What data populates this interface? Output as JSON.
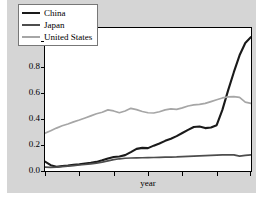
{
  "chart_data": {
    "type": "line",
    "title": "",
    "xlabel": "year",
    "ylabel": "",
    "y_offset_text": "1e7",
    "y_offset_multiplier": 10000000,
    "yticks": [
      "0.0",
      "0.2",
      "0.4",
      "0.6",
      "0.8",
      "1.0"
    ],
    "ylim": [
      0.0,
      1.1
    ],
    "xlim": [
      0,
      36
    ],
    "xtick_count": 7,
    "xtick_labels": [],
    "grid": false,
    "legend_position": "upper left",
    "series": [
      {
        "name": "China",
        "color": "#1a1a1a",
        "values": [
          0.072,
          0.045,
          0.032,
          0.038,
          0.042,
          0.048,
          0.052,
          0.058,
          0.063,
          0.07,
          0.082,
          0.096,
          0.108,
          0.112,
          0.122,
          0.145,
          0.17,
          0.178,
          0.176,
          0.195,
          0.212,
          0.232,
          0.248,
          0.268,
          0.292,
          0.316,
          0.338,
          0.342,
          0.33,
          0.335,
          0.352,
          0.47,
          0.62,
          0.76,
          0.89,
          0.985,
          1.03
        ]
      },
      {
        "name": "Japan",
        "color": "#4d4d4d",
        "values": [
          0.03,
          0.028,
          0.03,
          0.034,
          0.038,
          0.042,
          0.046,
          0.05,
          0.055,
          0.06,
          0.068,
          0.078,
          0.088,
          0.094,
          0.098,
          0.1,
          0.101,
          0.102,
          0.103,
          0.104,
          0.105,
          0.106,
          0.107,
          0.108,
          0.11,
          0.112,
          0.114,
          0.116,
          0.118,
          0.12,
          0.122,
          0.124,
          0.125,
          0.124,
          0.114,
          0.12,
          0.124
        ]
      },
      {
        "name": "United States",
        "color": "#a6a6a6",
        "values": [
          0.29,
          0.31,
          0.33,
          0.348,
          0.362,
          0.378,
          0.392,
          0.408,
          0.424,
          0.44,
          0.452,
          0.47,
          0.462,
          0.448,
          0.462,
          0.482,
          0.472,
          0.458,
          0.448,
          0.446,
          0.456,
          0.47,
          0.478,
          0.474,
          0.486,
          0.5,
          0.508,
          0.512,
          0.52,
          0.534,
          0.548,
          0.562,
          0.57,
          0.572,
          0.566,
          0.53,
          0.52
        ]
      }
    ]
  },
  "legend": {
    "entries": [
      {
        "label": "China"
      },
      {
        "label": "Japan"
      },
      {
        "label": "United States"
      }
    ]
  },
  "axes": {
    "offset_label": "1e7",
    "x_axis_label": "year",
    "ytick_labels": [
      "1.0",
      "0.8",
      "0.6",
      "0.4",
      "0.2",
      "0.0"
    ]
  }
}
